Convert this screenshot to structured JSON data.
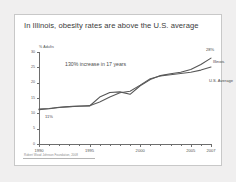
{
  "slide": {
    "title": "In Illinois, obesity rates are above the U.S. average",
    "footnote": "Robert Wood Johnson Foundation, 2008"
  },
  "chart_data": {
    "type": "line",
    "title": "In Illinois, obesity rates are above the U.S. average",
    "xlabel": "",
    "ylabel": "% Adults",
    "ylim": [
      0,
      30
    ],
    "xlim": [
      1990,
      2007
    ],
    "yticks": [
      0,
      5,
      10,
      15,
      20,
      25,
      30
    ],
    "ytick_labels": [
      "0",
      "5",
      "10",
      "15",
      "20",
      "25",
      "30"
    ],
    "xticks": [
      1990,
      1995,
      2000,
      2005,
      2007
    ],
    "xtick_labels": [
      "1990",
      "1995",
      "2000",
      "2005",
      "2007"
    ],
    "grid": false,
    "legend": "inline-right",
    "annotations": [
      {
        "text": "130% increase in 17 years",
        "x": 1992,
        "y": 27
      },
      {
        "text": "11%",
        "x": 1990,
        "y": 11
      },
      {
        "text": "28%",
        "x": 2007,
        "y": 28
      }
    ],
    "x": [
      1990,
      1991,
      1992,
      1993,
      1994,
      1995,
      1996,
      1997,
      1998,
      1999,
      2000,
      2001,
      2002,
      2003,
      2004,
      2005,
      2006,
      2007
    ],
    "series": [
      {
        "name": "Illinois",
        "color": "#555555",
        "values": [
          11.4,
          11.6,
          12.0,
          12.2,
          12.3,
          12.4,
          15.3,
          16.8,
          17.0,
          16.2,
          19.0,
          21.0,
          22.3,
          22.9,
          23.4,
          24.3,
          25.9,
          28.0
        ]
      },
      {
        "name": "U.S. Average",
        "color": "#5a5a5a",
        "values": [
          11.2,
          11.5,
          11.9,
          12.2,
          12.4,
          12.5,
          13.7,
          15.3,
          16.7,
          17.2,
          19.2,
          21.3,
          22.2,
          22.6,
          23.0,
          23.4,
          24.1,
          25.1
        ]
      }
    ]
  },
  "axis": {
    "ylabel": "% Adults"
  }
}
